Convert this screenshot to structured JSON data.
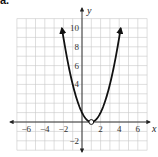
{
  "problem_label": "a.",
  "chart_data": {
    "type": "line",
    "title": "",
    "function": "y = (x - 1)^2",
    "xlabel": "x",
    "ylabel": "y",
    "xlim": [
      -7,
      7
    ],
    "ylim": [
      -3,
      11
    ],
    "grid": true,
    "x_tick_labels": [
      "-6",
      "-4",
      "-2",
      "2",
      "4",
      "6"
    ],
    "x_ticks": [
      -6,
      -4,
      -2,
      2,
      4,
      6
    ],
    "y_tick_labels": [
      "10",
      "8",
      "6",
      "4",
      "-2"
    ],
    "y_ticks": [
      10,
      8,
      6,
      4,
      -2
    ],
    "series": [
      {
        "name": "parabola",
        "x": [
          -2.16,
          -2,
          -1,
          0,
          1,
          2,
          3,
          4,
          4.16
        ],
        "y": [
          10,
          9,
          4,
          1,
          0,
          1,
          4,
          9,
          10
        ],
        "arrows_at_ends": true
      }
    ],
    "annotations": [
      {
        "type": "open-circle",
        "x": 1,
        "y": 0,
        "note": "point excluded"
      }
    ],
    "colors": {
      "curve": "#111111",
      "grid": "#c8c8c8",
      "axis": "#222222"
    }
  }
}
